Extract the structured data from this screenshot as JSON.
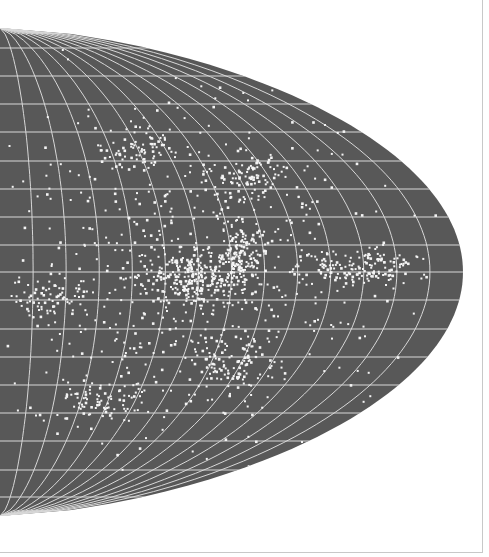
{
  "figure": {
    "kind": "sky-map",
    "projection": "equal-area (half hemisphere, parabolic boundary)",
    "colors": {
      "background": "#ffffff",
      "map_fill": "#585858",
      "grid_lines": "#d8d8d8",
      "points": "#f4f4f4",
      "frame": "#c8c8c8"
    },
    "boundary": {
      "left_top": [
        0,
        28
      ],
      "tip": [
        463,
        272
      ],
      "left_bottom": [
        0,
        516
      ]
    },
    "parallels_y": [
      48,
      76,
      104,
      132,
      161,
      189,
      217,
      245,
      272,
      300,
      329,
      357,
      385,
      413,
      441,
      470,
      497
    ],
    "meridian_count": 14,
    "clusters": [
      {
        "name": "central-dense-band",
        "cx": 200,
        "cy": 275,
        "rx": 70,
        "ry": 35,
        "n": 260
      },
      {
        "name": "upper-center-filament",
        "cx": 240,
        "cy": 250,
        "rx": 30,
        "ry": 40,
        "n": 120
      },
      {
        "name": "right-band",
        "cx": 360,
        "cy": 268,
        "rx": 80,
        "ry": 22,
        "n": 150
      },
      {
        "name": "upper-group",
        "cx": 140,
        "cy": 150,
        "rx": 50,
        "ry": 25,
        "n": 70
      },
      {
        "name": "upper-right-group",
        "cx": 250,
        "cy": 175,
        "rx": 60,
        "ry": 30,
        "n": 90
      },
      {
        "name": "left-band",
        "cx": 50,
        "cy": 300,
        "rx": 45,
        "ry": 25,
        "n": 70
      },
      {
        "name": "lower-group",
        "cx": 100,
        "cy": 400,
        "rx": 60,
        "ry": 30,
        "n": 80
      },
      {
        "name": "lower-right-group",
        "cx": 230,
        "cy": 360,
        "rx": 60,
        "ry": 35,
        "n": 100
      },
      {
        "name": "scattered-field",
        "cx": 200,
        "cy": 272,
        "rx": 240,
        "ry": 220,
        "n": 600
      }
    ]
  }
}
